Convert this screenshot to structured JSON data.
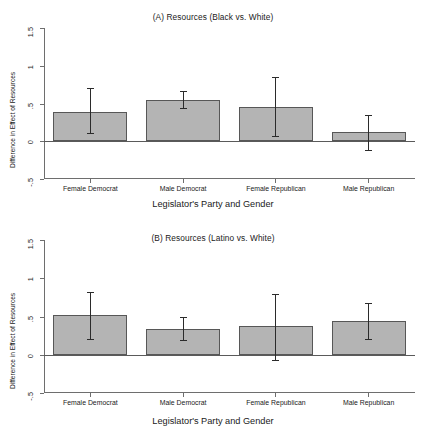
{
  "figure": {
    "background": "#ffffff",
    "bar_fill": "#b4b4b4",
    "bar_border": "#575757",
    "axis_color": "#6e6e6e",
    "error_color": "#2b2b2b"
  },
  "chart_data": [
    {
      "type": "bar",
      "panel": "A",
      "title": "(A) Resources (Black vs. White)",
      "xlabel": "Legislator's Party and Gender",
      "ylabel": "Difference in Effect of Resources",
      "categories": [
        "Female Democrat",
        "Male Democrat",
        "Female Republican",
        "Male Republican"
      ],
      "values": [
        0.39,
        0.55,
        0.46,
        0.12
      ],
      "error_low": [
        0.11,
        0.44,
        0.07,
        -0.11
      ],
      "error_high": [
        0.7,
        0.66,
        0.85,
        0.35
      ],
      "ylim": [
        -0.5,
        1.5
      ],
      "yticks": [
        1.5,
        1,
        0.5,
        0,
        -0.5
      ],
      "ytick_labels": [
        "1.5",
        "1",
        ".5",
        "0",
        "-.5"
      ],
      "grid": false,
      "legend": "none"
    },
    {
      "type": "bar",
      "panel": "B",
      "title": "(B) Resources (Latino vs. White)",
      "xlabel": "Legislator's Party and Gender",
      "ylabel": "Difference in Effect of Resources",
      "categories": [
        "Female Democrat",
        "Male Democrat",
        "Female Republican",
        "Male Republican"
      ],
      "values": [
        0.52,
        0.34,
        0.38,
        0.44
      ],
      "error_low": [
        0.21,
        0.19,
        -0.07,
        0.21
      ],
      "error_high": [
        0.82,
        0.5,
        0.8,
        0.67
      ],
      "ylim": [
        -0.5,
        1.5
      ],
      "yticks": [
        1.5,
        1,
        0.5,
        0,
        -0.5
      ],
      "ytick_labels": [
        "1.5",
        "1",
        ".5",
        "0",
        "-.5"
      ],
      "grid": false,
      "legend": "none"
    }
  ]
}
